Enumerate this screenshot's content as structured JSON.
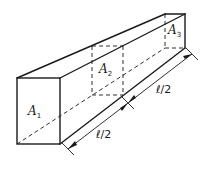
{
  "diagram": {
    "type": "isometric-bar",
    "labels": {
      "a1": {
        "main": "A",
        "sub": "1"
      },
      "a2": {
        "main": "A",
        "sub": "2"
      },
      "a3": {
        "main": "A",
        "sub": "3"
      }
    },
    "dimensions": {
      "first_half": "ℓ/2",
      "second_half": "ℓ/2"
    },
    "colors": {
      "line": "#1a1a1a",
      "background": "#ffffff"
    }
  }
}
